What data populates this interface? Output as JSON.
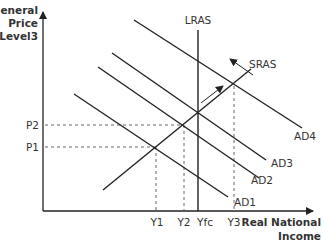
{
  "diagram": {
    "y_axis_label": [
      "General",
      "Price",
      "Level3"
    ],
    "x_axis_label": [
      "Real National",
      "Income"
    ],
    "curves": {
      "lras": "LRAS",
      "sras": "SRAS",
      "ad1": "AD1",
      "ad2": "AD2",
      "ad3": "AD3",
      "ad4": "AD4"
    },
    "price_levels": [
      "P2",
      "P1"
    ],
    "income_levels": [
      "Y1",
      "Y2",
      "Yfc",
      "Y3"
    ],
    "colors": {
      "line": "#222222",
      "dashed": "#555555",
      "text": "#333333"
    }
  }
}
